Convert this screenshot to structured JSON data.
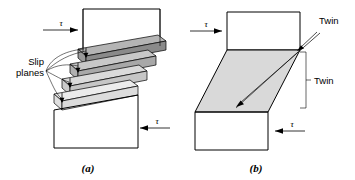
{
  "figure": {
    "panels": [
      {
        "id": "a",
        "caption": "(a)",
        "mechanism": "slip",
        "labels": [
          {
            "name": "slip-planes",
            "line1": "Slip",
            "line2": "planes"
          }
        ],
        "shear_arrows": [
          {
            "name": "top-shear",
            "symbol": "τ",
            "direction": "right"
          },
          {
            "name": "bottom-shear",
            "symbol": "τ",
            "direction": "left"
          }
        ],
        "step_count": 4,
        "step_fills": [
          "#8a8a8a",
          "#a8a8a8",
          "#c6c6c6",
          "#dcdcdc"
        ],
        "step_top_fills": [
          "#b4b4b4",
          "#c8c8c8",
          "#dadada",
          "#ececec"
        ]
      },
      {
        "id": "b",
        "caption": "(b)",
        "mechanism": "twinning",
        "labels": [
          {
            "name": "twin-planes",
            "line1": "Twin",
            "line2": "planes"
          },
          {
            "name": "twin-region",
            "line1": "Twin",
            "line2": ""
          }
        ],
        "shear_arrows": [
          {
            "name": "top-shear",
            "symbol": "τ",
            "direction": "right"
          },
          {
            "name": "bottom-shear",
            "symbol": "τ",
            "direction": "left"
          }
        ],
        "twin_fill": "#d9d9d9"
      }
    ],
    "colors": {
      "stroke": "#000000",
      "background": "#ffffff",
      "twin_band": "#d9d9d9",
      "dark_step": "#8a8a8a"
    }
  }
}
